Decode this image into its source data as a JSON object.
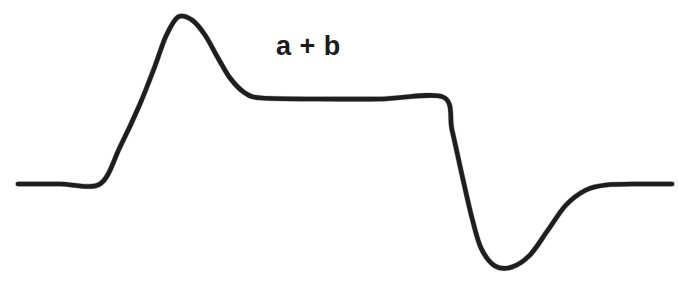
{
  "figure": {
    "background_color": "#ffffff",
    "stroke_color": "#1e1e1e",
    "annotation": {
      "text": "a + b",
      "x": 276,
      "y": 33,
      "font_size": 27,
      "font_weight": "bold",
      "color": "#1b1b1b"
    }
  },
  "chart_data": {
    "type": "line",
    "title": "",
    "subtitle": "",
    "xlabel": "",
    "ylabel": "",
    "xlim": [
      0,
      678
    ],
    "ylim": [
      283,
      0
    ],
    "grid": false,
    "legend": null,
    "axes_visible": false,
    "annotations": [
      {
        "text": "a + b",
        "x": 310,
        "y": 50
      }
    ],
    "series": [
      {
        "name": "dispersion-lineshape",
        "stroke_width": 4.6,
        "color": "#1e1e1e",
        "points": [
          {
            "x": 18,
            "y": 184,
            "role": "left-baseline-start"
          },
          {
            "x": 60,
            "y": 184,
            "role": "left-baseline"
          },
          {
            "x": 100,
            "y": 184,
            "role": "rise-onset"
          },
          {
            "x": 120,
            "y": 147,
            "role": "rising-edge"
          },
          {
            "x": 140,
            "y": 104,
            "role": "rising-edge"
          },
          {
            "x": 155,
            "y": 66,
            "role": "rising-edge"
          },
          {
            "x": 166,
            "y": 36,
            "role": "rising-edge"
          },
          {
            "x": 178,
            "y": 17,
            "role": "peak-apex"
          },
          {
            "x": 192,
            "y": 20,
            "role": "peak-falloff"
          },
          {
            "x": 205,
            "y": 35,
            "role": "peak-falloff"
          },
          {
            "x": 218,
            "y": 58,
            "role": "peak-falloff"
          },
          {
            "x": 230,
            "y": 78,
            "role": "peak-falloff"
          },
          {
            "x": 245,
            "y": 93,
            "role": "plateau-entry"
          },
          {
            "x": 262,
            "y": 98,
            "role": "plateau"
          },
          {
            "x": 320,
            "y": 99,
            "role": "plateau"
          },
          {
            "x": 380,
            "y": 99,
            "role": "plateau"
          },
          {
            "x": 443,
            "y": 97,
            "role": "plateau-end-corner"
          },
          {
            "x": 452,
            "y": 130,
            "role": "falling-edge"
          },
          {
            "x": 462,
            "y": 175,
            "role": "falling-edge"
          },
          {
            "x": 472,
            "y": 218,
            "role": "falling-edge"
          },
          {
            "x": 481,
            "y": 248,
            "role": "falling-edge"
          },
          {
            "x": 495,
            "y": 266,
            "role": "trough-bottom"
          },
          {
            "x": 512,
            "y": 267,
            "role": "trough-bottom"
          },
          {
            "x": 530,
            "y": 255,
            "role": "recovery"
          },
          {
            "x": 548,
            "y": 230,
            "role": "recovery"
          },
          {
            "x": 566,
            "y": 205,
            "role": "recovery"
          },
          {
            "x": 586,
            "y": 190,
            "role": "recovery"
          },
          {
            "x": 606,
            "y": 185,
            "role": "right-baseline"
          },
          {
            "x": 640,
            "y": 184,
            "role": "right-baseline"
          },
          {
            "x": 672,
            "y": 184,
            "role": "right-baseline-end"
          }
        ]
      }
    ]
  }
}
